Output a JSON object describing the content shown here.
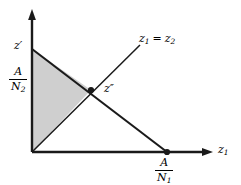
{
  "figure": {
    "type": "geometric-diagram",
    "background_color": "#ffffff",
    "line_color": "#1a1a1a",
    "shade_color": "#cfcfcf",
    "axes": {
      "x_axis": {
        "label": "z",
        "subscript": "1",
        "origin": [
          32,
          152
        ],
        "arrow_tip": [
          212,
          152
        ]
      },
      "y_axis": {
        "label": "",
        "origin": [
          32,
          152
        ],
        "arrow_tip": [
          32,
          10
        ]
      }
    },
    "labels": {
      "z_prime": {
        "base": "z",
        "prime": "′",
        "position": [
          14,
          40
        ]
      },
      "z_double_prime": {
        "base": "z",
        "prime": "″",
        "position": [
          104,
          83
        ]
      },
      "diagonal_line": {
        "text": "z₁ = z₂",
        "base_left": "z",
        "sub_left": "1",
        "equals": "=",
        "base_right": "z",
        "sub_right": "2",
        "position": [
          139,
          33
        ]
      },
      "axis_x": {
        "base": "z",
        "sub": "1",
        "position": [
          218,
          144
        ]
      }
    },
    "fractions": {
      "y_intercept": {
        "numerator": "A",
        "denominator": "N",
        "denominator_sub": "2",
        "position": [
          9,
          66
        ]
      },
      "x_intercept": {
        "numerator": "A",
        "denominator": "N",
        "denominator_sub": "1",
        "position": [
          155,
          157
        ]
      }
    },
    "points": {
      "origin": [
        32,
        152
      ],
      "z_prime_point": [
        32,
        49
      ],
      "intersection": [
        91,
        90
      ],
      "x_intercept_point": [
        167,
        152
      ]
    },
    "shaded_region": {
      "vertices": [
        [
          32,
          49
        ],
        [
          32,
          152
        ],
        [
          91,
          90
        ]
      ],
      "description": "shaded triangle bounded by vertical axis, budget line and z1=z2 ray"
    }
  }
}
